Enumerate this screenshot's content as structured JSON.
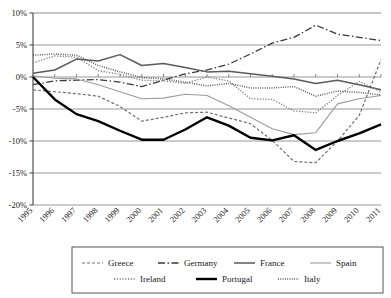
{
  "chart_data": {
    "type": "line",
    "title": "",
    "subtitle": "",
    "xlabel": "",
    "ylabel": "",
    "grid": true,
    "legend_position": "bottom",
    "xlim": [
      1995,
      2011
    ],
    "ylim": [
      -20,
      10
    ],
    "ytick_labels": [
      "10%",
      "5%",
      "0%",
      "-5%",
      "-10%",
      "-15%",
      "-20%"
    ],
    "ytick_values": [
      10,
      5,
      0,
      -5,
      -10,
      -15,
      -20
    ],
    "categories": [
      1995,
      1996,
      1997,
      1998,
      1999,
      2000,
      2001,
      2002,
      2003,
      2004,
      2005,
      2006,
      2007,
      2008,
      2009,
      2010,
      2011
    ],
    "xtick_labels": [
      "1995",
      "1996",
      "1997",
      "1998",
      "1999",
      "2000",
      "2001",
      "2002",
      "2003",
      "2004",
      "2005",
      "2006",
      "2007",
      "2008",
      "2009",
      "2010",
      "2011"
    ],
    "series": [
      {
        "name": "Greece",
        "style": "dashed",
        "color": "#6f6f6f",
        "width": 1.2,
        "dash": "3,2",
        "values": [
          -2.0,
          -2.3,
          -2.6,
          -3.0,
          -4.6,
          -6.9,
          -6.3,
          -5.6,
          -5.5,
          -6.4,
          -7.3,
          -9.9,
          -13.2,
          -13.4,
          -10.0,
          -6.0,
          2.7
        ]
      },
      {
        "name": "Germany",
        "style": "dash-dot",
        "color": "#3a3a3a",
        "width": 1.3,
        "dash": "7,2.5,1.5,2.5",
        "values": [
          -1.2,
          -0.6,
          -0.5,
          -0.4,
          -0.8,
          -1.5,
          -0.5,
          0.5,
          1.1,
          2.0,
          3.6,
          5.3,
          6.2,
          8.1,
          6.7,
          6.2,
          5.7
        ]
      },
      {
        "name": "France",
        "style": "solid",
        "color": "#5a5a5a",
        "width": 1.5,
        "dash": "",
        "values": [
          0.6,
          1.1,
          2.8,
          2.5,
          3.5,
          1.8,
          2.1,
          1.5,
          0.8,
          0.9,
          0.5,
          0.1,
          -0.3,
          -1.0,
          -0.5,
          -1.2,
          -2.0
        ]
      },
      {
        "name": "Spain",
        "style": "solid-thin",
        "color": "#9b9b9b",
        "width": 1.1,
        "dash": "",
        "values": [
          0.2,
          -0.2,
          -0.3,
          -1.2,
          -2.3,
          -3.4,
          -3.3,
          -2.7,
          -2.9,
          -4.5,
          -6.3,
          -8.1,
          -9.0,
          -8.7,
          -4.2,
          -3.4,
          -2.9
        ]
      },
      {
        "name": "Ireland",
        "style": "dotted",
        "color": "#7a7a7a",
        "width": 1.3,
        "dash": "1.2,1.6",
        "values": [
          2.2,
          3.3,
          3.1,
          1.0,
          0.4,
          -0.5,
          -0.6,
          -1.0,
          0.0,
          -0.6,
          -3.4,
          -3.5,
          -5.3,
          -5.6,
          -2.9,
          -0.7,
          -2.3
        ]
      },
      {
        "name": "Portugal",
        "style": "solid-thick",
        "color": "#000000",
        "width": 2.4,
        "dash": "",
        "values": [
          0.0,
          -3.5,
          -5.8,
          -6.9,
          -8.4,
          -9.8,
          -9.8,
          -8.2,
          -6.3,
          -7.6,
          -9.5,
          -9.9,
          -9.1,
          -11.4,
          -10.0,
          -8.8,
          -7.4
        ]
      },
      {
        "name": "Italy",
        "style": "fine-dotted",
        "color": "#4a4a4a",
        "width": 1.5,
        "dash": "0.9,1.4",
        "values": [
          3.4,
          3.6,
          3.4,
          1.8,
          0.8,
          -0.1,
          -0.3,
          -0.8,
          -1.4,
          -1.0,
          -1.7,
          -1.7,
          -1.5,
          -3.0,
          -2.2,
          -2.4,
          -2.8
        ]
      }
    ]
  },
  "legend": {
    "row1": [
      "Greece",
      "Germany",
      "France",
      "Spain"
    ],
    "row2": [
      "Ireland",
      "Portugal",
      "Italy"
    ]
  }
}
